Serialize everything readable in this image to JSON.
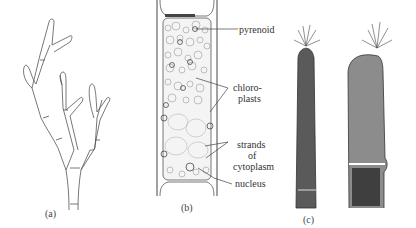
{
  "figure": {
    "panels": [
      {
        "id": "a",
        "caption": "(a)",
        "subject": "branched filamentous alga"
      },
      {
        "id": "b",
        "caption": "(b)",
        "subject": "single cell with chloroplasts"
      },
      {
        "id": "c",
        "caption": "(c)",
        "subject": "filament tips with tufted apices"
      }
    ],
    "labels": {
      "pyrenoid": "pyrenoid",
      "chloroplasts_1": "chloro-",
      "chloroplasts_2": "plasts",
      "strands_1": "strands",
      "strands_2": "of",
      "strands_3": "cytoplasm",
      "nucleus": "nucleus"
    }
  }
}
